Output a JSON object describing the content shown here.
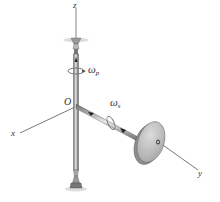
{
  "diagram": {
    "axes": {
      "x_label": "x",
      "y_label": "y",
      "z_label": "z"
    },
    "origin_label": "O",
    "angular_velocities": {
      "precession": {
        "symbol": "ω",
        "subscript": "p"
      },
      "spin": {
        "symbol": "ω",
        "subscript": "s"
      }
    },
    "colors": {
      "shaft": "#8a8a8a",
      "disk_face": "#c8c8c8",
      "disk_rim": "#9a9a9a",
      "axis_line": "#555555",
      "background": "#ffffff"
    }
  }
}
